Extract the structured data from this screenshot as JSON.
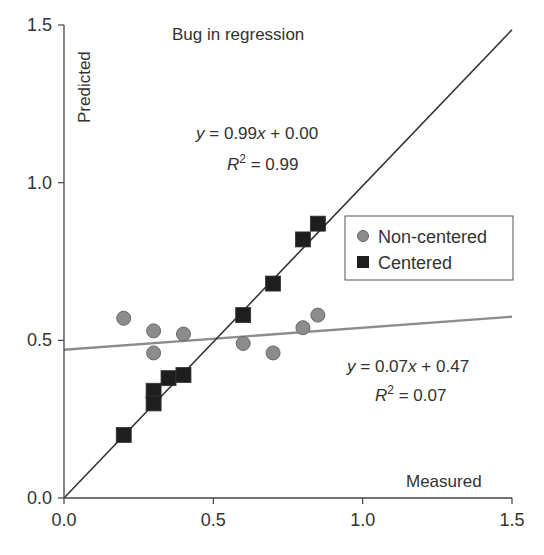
{
  "chart_data": {
    "type": "scatter",
    "title": "Bug in regression",
    "xlabel": "Measured",
    "ylabel": "Predicted",
    "xlim": [
      0,
      1.5
    ],
    "ylim": [
      0,
      1.5
    ],
    "xticks": [
      "0.0",
      "0.5",
      "1.0",
      "1.5"
    ],
    "yticks": [
      "0.0",
      "0.5",
      "1.0",
      "1.5"
    ],
    "xtick_values": [
      0,
      0.5,
      1.0,
      1.5
    ],
    "ytick_values": [
      0,
      0.5,
      1.0,
      1.5
    ],
    "grid": false,
    "legend_position": "right",
    "series": [
      {
        "name": "Non-centered",
        "marker": "circle",
        "color": "#8c8c8c",
        "x": [
          0.2,
          0.3,
          0.3,
          0.4,
          0.6,
          0.7,
          0.8,
          0.85
        ],
        "y": [
          0.57,
          0.53,
          0.46,
          0.52,
          0.49,
          0.46,
          0.54,
          0.58
        ],
        "fit": {
          "slope": 0.07,
          "intercept": 0.47,
          "line_color": "#8c8c8c",
          "equation": "y = 0.07x + 0.47",
          "r2_label": "R² = 0.07",
          "r2": "0.07"
        }
      },
      {
        "name": "Centered",
        "marker": "square",
        "color": "#1e1e1e",
        "x": [
          0.2,
          0.3,
          0.3,
          0.35,
          0.4,
          0.6,
          0.7,
          0.8,
          0.85
        ],
        "y": [
          0.2,
          0.34,
          0.3,
          0.38,
          0.39,
          0.58,
          0.68,
          0.82,
          0.87
        ],
        "fit": {
          "slope": 0.99,
          "intercept": 0.0,
          "line_color": "#333333",
          "equation": "y = 0.99x + 0.00",
          "r2_label": "R² = 0.99",
          "r2": "0.99"
        }
      }
    ]
  }
}
